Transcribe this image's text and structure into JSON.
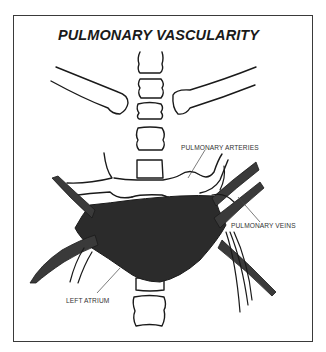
{
  "diagram": {
    "title": "PULMONARY VASCULARITY",
    "labels": {
      "pulmonary_arteries": "PULMONARY ARTERIES",
      "pulmonary_veins": "PULMONARY VEINS",
      "left_atrium": "LEFT ATRIUM"
    },
    "structures": [
      "spine-vertebrae",
      "clavicles",
      "pulmonary-arteries",
      "pulmonary-veins",
      "left-atrium"
    ],
    "colors": {
      "outline": "#1a1a1a",
      "atrium_fill": "#2b2b2b",
      "vein_fill": "#3a3a3a",
      "background": "#ffffff"
    }
  }
}
